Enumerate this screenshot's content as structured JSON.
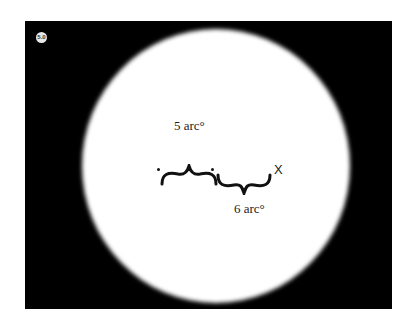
{
  "figure": {
    "badge": "5.0",
    "labels": {
      "upper": "5 arc°",
      "lower": "6 arc°",
      "target": "X"
    },
    "colors": {
      "background": "#000000",
      "disk": "#ffffff",
      "text": "#222222"
    }
  }
}
